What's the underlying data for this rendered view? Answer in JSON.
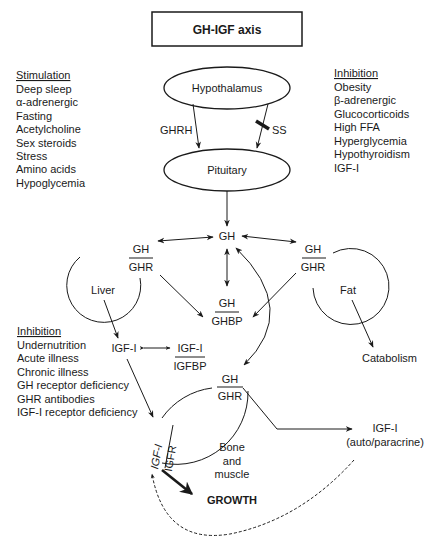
{
  "title": "GH-IGF axis",
  "stimulation": {
    "heading": "Stimulation",
    "items": [
      "Deep sleep",
      "α-adrenergic",
      "Fasting",
      "Acetylcholine",
      "Sex steroids",
      "Stress",
      "Amino acids",
      "Hypoglycemia"
    ]
  },
  "inhibition_top": {
    "heading": "Inhibition",
    "items": [
      "Obesity",
      "β-adrenergic",
      "Glucocorticoids",
      "High FFA",
      "Hyperglycemia",
      "Hypothyroidism",
      "IGF-I"
    ]
  },
  "inhibition_bottom": {
    "heading": "Inhibition",
    "items": [
      "Undernutrition",
      "Acute illness",
      "Chronic illness",
      "GH receptor deficiency",
      "GHR antibodies",
      "IGF-I receptor deficiency"
    ]
  },
  "nodes": {
    "hypothalamus": "Hypothalamus",
    "pituitary": "Pituitary",
    "ghrh": "GHRH",
    "ss": "SS",
    "gh_center": "GH",
    "liver": "Liver",
    "fat": "Fat",
    "catabolism": "Catabolism",
    "liver_receptor": {
      "top": "GH",
      "bottom": "GHR"
    },
    "fat_receptor": {
      "top": "GH",
      "bottom": "GHR"
    },
    "ghbp": {
      "top": "GH",
      "bottom": "GHBP"
    },
    "igf1_liver": "IGF-I",
    "igfbp": {
      "top": "IGF-I",
      "bottom": "IGFBP"
    },
    "bone_receptor": {
      "top": "GH",
      "bottom": "GHR"
    },
    "igfr": {
      "top": "IGF-I",
      "bottom": "IGFR"
    },
    "bone_muscle": [
      "Bone",
      "and",
      "muscle"
    ],
    "growth": "GROWTH",
    "igf1_auto": "IGF-I",
    "auto_paracrine": "(auto/paracrine)"
  }
}
